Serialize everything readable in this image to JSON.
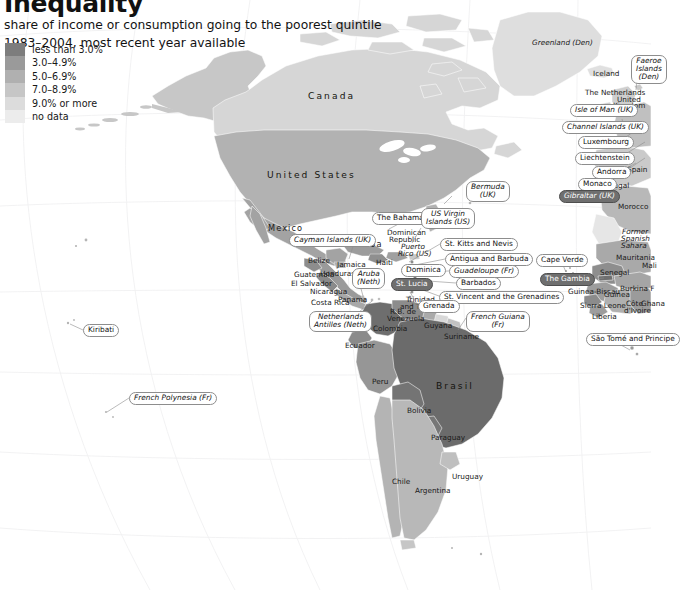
{
  "header": {
    "title": "Inequality",
    "subtitle_line1": "share of income or consumption going to the poorest quintile",
    "subtitle_line2": "1983–2004, most recent year available"
  },
  "legend": {
    "items": [
      {
        "label": "less than 3.0%",
        "color": "#7d7d7d"
      },
      {
        "label": "3.0–4.9%",
        "color": "#9a9a9a"
      },
      {
        "label": "5.0–6.9%",
        "color": "#b0b0b0"
      },
      {
        "label": "7.0–8.9%",
        "color": "#c6c6c6"
      },
      {
        "label": "9.0% or more",
        "color": "#dcdcdc"
      },
      {
        "label": "no data",
        "color": "#ececec"
      }
    ]
  },
  "map": {
    "background_color": "#ffffff",
    "graticule_color": "#f1f1f3",
    "country_labels": [
      {
        "name": "Canada",
        "x": 308,
        "y": 91,
        "style": "big"
      },
      {
        "name": "United States",
        "x": 267,
        "y": 170,
        "style": "big"
      },
      {
        "name": "Mexico",
        "x": 268,
        "y": 224,
        "style": "mid"
      },
      {
        "name": "Belize",
        "x": 308,
        "y": 257,
        "style": "plain"
      },
      {
        "name": "Cuba",
        "x": 357,
        "y": 240,
        "style": "mid"
      },
      {
        "name": "Jamaica",
        "x": 337,
        "y": 261,
        "style": "plain"
      },
      {
        "name": "Haiti",
        "x": 376,
        "y": 259,
        "style": "plain"
      },
      {
        "name": "Dominican",
        "x": 387,
        "y": 229,
        "style": "plain"
      },
      {
        "name": "Republic",
        "x": 389,
        "y": 236,
        "style": "plain"
      },
      {
        "name": "Puerto",
        "x": 401,
        "y": 243,
        "style": "italic"
      },
      {
        "name": "Rico (US)",
        "x": 398,
        "y": 250,
        "style": "italic"
      },
      {
        "name": "Guatemala",
        "x": 294,
        "y": 271,
        "style": "plain"
      },
      {
        "name": "Honduras",
        "x": 320,
        "y": 270,
        "style": "plain"
      },
      {
        "name": "El Salvador",
        "x": 291,
        "y": 280,
        "style": "plain"
      },
      {
        "name": "Nicaragua",
        "x": 310,
        "y": 288,
        "style": "plain"
      },
      {
        "name": "Costa Rica",
        "x": 311,
        "y": 299,
        "style": "plain"
      },
      {
        "name": "Panama",
        "x": 338,
        "y": 296,
        "style": "plain"
      },
      {
        "name": "Colombia",
        "x": 373,
        "y": 325,
        "style": "plain"
      },
      {
        "name": "Ecuador",
        "x": 345,
        "y": 342,
        "style": "plain"
      },
      {
        "name": "Peru",
        "x": 372,
        "y": 378,
        "style": "plain"
      },
      {
        "name": "Brasil",
        "x": 436,
        "y": 381,
        "style": "big"
      },
      {
        "name": "Bolivia",
        "x": 407,
        "y": 407,
        "style": "plain"
      },
      {
        "name": "Paraguay",
        "x": 431,
        "y": 434,
        "style": "plain"
      },
      {
        "name": "Uruguay",
        "x": 452,
        "y": 473,
        "style": "plain"
      },
      {
        "name": "Argentina",
        "x": 415,
        "y": 487,
        "style": "plain"
      },
      {
        "name": "Chile",
        "x": 392,
        "y": 478,
        "style": "plain"
      },
      {
        "name": "Suriname",
        "x": 444,
        "y": 333,
        "style": "plain"
      },
      {
        "name": "Guyana",
        "x": 424,
        "y": 322,
        "style": "plain"
      },
      {
        "name": "R.B. de",
        "x": 390,
        "y": 308,
        "style": "plain"
      },
      {
        "name": "Venezuela",
        "x": 387,
        "y": 315,
        "style": "plain"
      },
      {
        "name": "Trinidad",
        "x": 406,
        "y": 296,
        "style": "plain"
      },
      {
        "name": "and Tobago",
        "x": 400,
        "y": 303,
        "style": "plain"
      },
      {
        "name": "Greenland (Den)",
        "x": 532,
        "y": 39,
        "style": "italic"
      },
      {
        "name": "Iceland",
        "x": 593,
        "y": 70,
        "style": "plain"
      },
      {
        "name": "The Netherlands",
        "x": 585,
        "y": 89,
        "style": "plain"
      },
      {
        "name": "United",
        "x": 617,
        "y": 96,
        "style": "plain"
      },
      {
        "name": "Kingdom",
        "x": 613,
        "y": 102,
        "style": "plain"
      },
      {
        "name": "Ireland",
        "x": 610,
        "y": 110,
        "style": "plain"
      },
      {
        "name": "Spain",
        "x": 627,
        "y": 166,
        "style": "plain"
      },
      {
        "name": "Portugal",
        "x": 599,
        "y": 182,
        "style": "plain"
      },
      {
        "name": "Morocco",
        "x": 618,
        "y": 203,
        "style": "plain"
      },
      {
        "name": "Former",
        "x": 622,
        "y": 228,
        "style": "italic"
      },
      {
        "name": "Spanish",
        "x": 621,
        "y": 235,
        "style": "italic"
      },
      {
        "name": "Sahara",
        "x": 621,
        "y": 242,
        "style": "italic"
      },
      {
        "name": "Mauritania",
        "x": 616,
        "y": 254,
        "style": "plain"
      },
      {
        "name": "Senegal",
        "x": 600,
        "y": 269,
        "style": "plain"
      },
      {
        "name": "Guinea-Bissau",
        "x": 568,
        "y": 288,
        "style": "plain"
      },
      {
        "name": "Guinea",
        "x": 604,
        "y": 291,
        "style": "plain"
      },
      {
        "name": "Sierra Leone",
        "x": 580,
        "y": 302,
        "style": "plain"
      },
      {
        "name": "Liberia",
        "x": 592,
        "y": 313,
        "style": "plain"
      },
      {
        "name": "Côte",
        "x": 626,
        "y": 300,
        "style": "plain"
      },
      {
        "name": "d'Ivoire",
        "x": 624,
        "y": 307,
        "style": "plain"
      },
      {
        "name": "Ghana",
        "x": 641,
        "y": 300,
        "style": "plain"
      },
      {
        "name": "Burkina F",
        "x": 620,
        "y": 285,
        "style": "plain"
      },
      {
        "name": "Mali",
        "x": 642,
        "y": 262,
        "style": "plain"
      }
    ],
    "callouts": [
      {
        "label": "Bermuda\n(UK)",
        "x": 466,
        "y": 181,
        "italic": true,
        "dark": false,
        "two_line": true,
        "tx": 452,
        "ty": 196,
        "lx": 444,
        "ly": 204
      },
      {
        "label": "The Bahamas",
        "x": 372,
        "y": 212,
        "italic": false,
        "dark": false,
        "two_line": false,
        "tx": 408,
        "ty": 219,
        "lx": 389,
        "ly": 229
      },
      {
        "label": "US Virgin\nIslands (US)",
        "x": 421,
        "y": 208,
        "italic": true,
        "dark": false,
        "two_line": true,
        "tx": 421,
        "ty": 228,
        "lx": 412,
        "ly": 243
      },
      {
        "label": "Cayman Islands (UK)",
        "x": 289,
        "y": 234,
        "italic": true,
        "dark": false,
        "two_line": false,
        "tx": 354,
        "ty": 243,
        "lx": 349,
        "ly": 259
      },
      {
        "label": "St. Kitts and Nevis",
        "x": 440,
        "y": 238,
        "italic": false,
        "dark": false,
        "two_line": false,
        "tx": 440,
        "ty": 244,
        "lx": 409,
        "ly": 262
      },
      {
        "label": "Antigua and Barbuda",
        "x": 445,
        "y": 253,
        "italic": false,
        "dark": false,
        "two_line": false,
        "tx": 445,
        "ty": 259,
        "lx": 410,
        "ly": 266
      },
      {
        "label": "Guadeloupe (Fr)",
        "x": 449,
        "y": 265,
        "italic": true,
        "dark": false,
        "two_line": false,
        "tx": 449,
        "ty": 271,
        "lx": 412,
        "ly": 272
      },
      {
        "label": "Barbados",
        "x": 456,
        "y": 277,
        "italic": false,
        "dark": false,
        "two_line": false,
        "tx": 456,
        "ty": 283,
        "lx": 414,
        "ly": 280
      },
      {
        "label": "St. Vincent and the Grenadines",
        "x": 439,
        "y": 291,
        "italic": false,
        "dark": false,
        "two_line": false,
        "tx": 439,
        "ty": 296,
        "lx": 412,
        "ly": 286
      },
      {
        "label": "Dominica",
        "x": 401,
        "y": 264,
        "italic": false,
        "dark": false,
        "two_line": false,
        "tx": 436,
        "ty": 270,
        "lx": 414,
        "ly": 274
      },
      {
        "label": "St. Lucia",
        "x": 391,
        "y": 278,
        "italic": false,
        "dark": true,
        "two_line": false,
        "tx": 422,
        "ty": 284,
        "lx": 414,
        "ly": 282
      },
      {
        "label": "Grenada",
        "x": 418,
        "y": 300,
        "italic": false,
        "dark": false,
        "two_line": false,
        "tx": 418,
        "ty": 306,
        "lx": 410,
        "ly": 292
      },
      {
        "label": "Aruba\n(Neth)",
        "x": 352,
        "y": 268,
        "italic": true,
        "dark": false,
        "two_line": true,
        "tx": 360,
        "ty": 285,
        "lx": 363,
        "ly": 296
      },
      {
        "label": "Netherlands\nAntilles (Neth)",
        "x": 309,
        "y": 311,
        "italic": true,
        "dark": false,
        "two_line": true,
        "tx": 352,
        "ty": 318,
        "lx": 372,
        "ly": 301
      },
      {
        "label": "French Guiana\n(Fr)",
        "x": 466,
        "y": 311,
        "italic": true,
        "dark": false,
        "two_line": true,
        "tx": 466,
        "ty": 318,
        "lx": 458,
        "ly": 330
      },
      {
        "label": "Cape Verde",
        "x": 536,
        "y": 254,
        "italic": false,
        "dark": false,
        "two_line": false,
        "tx": 562,
        "ty": 263,
        "lx": 566,
        "ly": 272
      },
      {
        "label": "The Gambia",
        "x": 540,
        "y": 273,
        "italic": false,
        "dark": true,
        "two_line": false,
        "tx": 581,
        "ty": 280,
        "lx": 604,
        "ly": 278
      },
      {
        "label": "São Tomé and Principe",
        "x": 586,
        "y": 333,
        "italic": false,
        "dark": false,
        "two_line": false,
        "tx": 612,
        "ty": 340,
        "lx": 630,
        "ly": 350
      },
      {
        "label": "Kiribati",
        "x": 83,
        "y": 324,
        "italic": false,
        "dark": false,
        "two_line": false,
        "tx": 83,
        "ty": 330,
        "lx": 70,
        "ly": 324
      },
      {
        "label": "French Polynesia (Fr)",
        "x": 129,
        "y": 392,
        "italic": true,
        "dark": false,
        "two_line": false,
        "tx": 129,
        "ty": 398,
        "lx": 107,
        "ly": 412
      },
      {
        "label": "Faeroe\nIslands\n(Den)",
        "x": 631,
        "y": 55,
        "italic": true,
        "dark": false,
        "two_line": true,
        "tx": 637,
        "ty": 78,
        "lx": 636,
        "ly": 90
      },
      {
        "label": "Isle of Man (UK)",
        "x": 570,
        "y": 104,
        "italic": true,
        "dark": false,
        "two_line": false,
        "tx": 617,
        "ty": 110,
        "lx": 614,
        "ly": 106
      },
      {
        "label": "Channel Islands (UK)",
        "x": 562,
        "y": 121,
        "italic": true,
        "dark": false,
        "two_line": false,
        "tx": 624,
        "ty": 127,
        "lx": 622,
        "ly": 119
      },
      {
        "label": "Luxembourg",
        "x": 578,
        "y": 136,
        "italic": false,
        "dark": false,
        "two_line": false,
        "tx": 619,
        "ty": 142,
        "lx": 640,
        "ly": 127
      },
      {
        "label": "Liechtenstein",
        "x": 575,
        "y": 152,
        "italic": false,
        "dark": false,
        "two_line": false,
        "tx": 619,
        "ty": 158,
        "lx": 645,
        "ly": 142
      },
      {
        "label": "Andorra",
        "x": 592,
        "y": 166,
        "italic": false,
        "dark": false,
        "two_line": false,
        "tx": 619,
        "ty": 172,
        "lx": 636,
        "ly": 163
      },
      {
        "label": "Monaco",
        "x": 578,
        "y": 178,
        "italic": false,
        "dark": false,
        "two_line": false,
        "tx": 606,
        "ty": 184,
        "lx": 645,
        "ly": 158
      },
      {
        "label": "Gibraltar (UK)",
        "x": 559,
        "y": 190,
        "italic": true,
        "dark": true,
        "two_line": false,
        "tx": 606,
        "ty": 196,
        "lx": 617,
        "ly": 189
      }
    ]
  }
}
